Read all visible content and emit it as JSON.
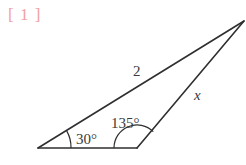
{
  "problem": {
    "label": "[ 1 ]",
    "label_color": "#f2a0a0"
  },
  "figure": {
    "type": "triangle-diagram",
    "stroke_color": "#2f2f2f",
    "text_color": "#3a3a3a",
    "background": "#ffffff",
    "vertices": {
      "left": {
        "x": 38,
        "y": 148
      },
      "bottom_right": {
        "x": 137,
        "y": 148
      },
      "apex": {
        "x": 244,
        "y": 21
      }
    },
    "angles": [
      {
        "name": "angle-left",
        "value": "30°",
        "at": "left",
        "label_x": 76,
        "label_y": 144
      },
      {
        "name": "angle-bottom-right",
        "value": "135°",
        "at": "bottom_right",
        "label_x": 111,
        "label_y": 128
      }
    ],
    "sides": [
      {
        "name": "side-long-upper",
        "label": "2",
        "italic": false,
        "label_x": 133,
        "label_y": 76
      },
      {
        "name": "side-right",
        "label": "x",
        "italic": true,
        "label_x": 194,
        "label_y": 100
      },
      {
        "name": "side-base",
        "label": "",
        "italic": false
      }
    ]
  }
}
